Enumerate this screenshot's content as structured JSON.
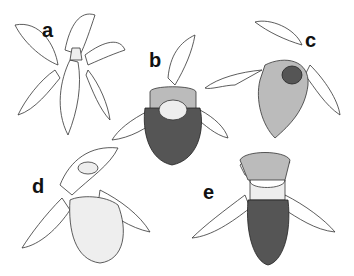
{
  "figure": {
    "panels": [
      {
        "label": "a",
        "subject": "orchid flower, front view, open petals"
      },
      {
        "label": "b",
        "subject": "orchid flower with dark stippled pouch"
      },
      {
        "label": "c",
        "subject": "orchid flower with mottled lip, side view"
      },
      {
        "label": "d",
        "subject": "orchid flower with pale inflated pouch"
      },
      {
        "label": "e",
        "subject": "orchid flower with dark stippled lower pouch"
      }
    ]
  }
}
